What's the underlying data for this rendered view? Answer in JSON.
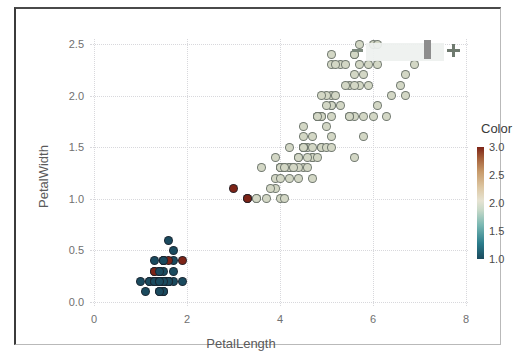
{
  "chart_data": {
    "type": "scatter",
    "title": "",
    "xlabel": "PetalLength",
    "ylabel": "PetalWidth",
    "xlim": [
      0,
      8
    ],
    "ylim": [
      0.0,
      2.5
    ],
    "xticks": [
      "0",
      "2",
      "4",
      "6",
      "8"
    ],
    "xtick_values": [
      0,
      2,
      4,
      6,
      8
    ],
    "yticks": [
      "0.0",
      "0.5",
      "1.0",
      "1.5",
      "2.0",
      "2.5"
    ],
    "ytick_values": [
      0.0,
      0.5,
      1.0,
      1.5,
      2.0,
      2.5
    ],
    "grid": true,
    "grid_style": "dotted",
    "legend": {
      "title": "Color",
      "position": "right",
      "ticks": [
        "3.0",
        "2.5",
        "2.0",
        "1.5",
        "1.0"
      ],
      "tick_values": [
        3.0,
        2.5,
        2.0,
        1.5,
        1.0
      ],
      "vmin": 1.0,
      "vmax": 3.0,
      "colormap": "diverging teal-beige-brown",
      "low_color": "#1b4a5e",
      "mid_color": "#e6e3d2",
      "high_color": "#7d2417"
    },
    "color_variable": "Color",
    "series": [
      {
        "name": "points",
        "x": [
          1.4,
          1.4,
          1.3,
          1.5,
          1.4,
          1.7,
          1.4,
          1.5,
          1.4,
          1.5,
          1.5,
          1.6,
          1.4,
          1.1,
          1.2,
          1.5,
          1.3,
          1.4,
          1.7,
          1.5,
          1.7,
          1.5,
          1.0,
          1.7,
          1.9,
          1.6,
          1.6,
          1.5,
          1.4,
          1.6,
          1.6,
          1.5,
          1.5,
          1.4,
          1.5,
          1.2,
          1.3,
          1.4,
          1.3,
          1.5,
          1.3,
          1.3,
          1.3,
          1.6,
          1.9,
          1.4,
          1.6,
          1.4,
          1.5,
          1.4,
          4.7,
          4.5,
          4.9,
          4.0,
          4.6,
          4.5,
          4.7,
          3.3,
          4.6,
          3.9,
          3.5,
          4.2,
          4.0,
          4.7,
          3.6,
          4.4,
          4.5,
          4.1,
          4.5,
          3.9,
          4.8,
          4.0,
          4.9,
          4.7,
          4.3,
          4.4,
          4.8,
          5.0,
          4.5,
          3.5,
          3.8,
          3.7,
          3.9,
          5.1,
          4.5,
          4.5,
          4.7,
          4.4,
          4.1,
          4.0,
          4.4,
          4.6,
          4.0,
          3.3,
          4.2,
          4.2,
          4.2,
          4.3,
          3.0,
          4.1,
          6.0,
          5.1,
          5.9,
          5.6,
          5.8,
          6.6,
          4.5,
          6.3,
          5.8,
          6.1,
          5.1,
          5.3,
          5.5,
          5.0,
          5.1,
          5.3,
          5.5,
          6.7,
          6.9,
          5.0,
          5.7,
          4.9,
          6.7,
          4.9,
          5.7,
          6.0,
          4.8,
          4.9,
          5.6,
          5.8,
          6.1,
          6.4,
          5.6,
          5.1,
          5.6,
          6.1,
          5.6,
          5.5,
          4.8,
          5.4,
          5.6,
          5.1,
          5.1,
          5.9,
          5.7,
          5.2,
          5.0,
          5.2,
          5.4,
          5.1
        ],
        "y": [
          0.2,
          0.2,
          0.2,
          0.2,
          0.2,
          0.4,
          0.3,
          0.2,
          0.2,
          0.1,
          0.2,
          0.2,
          0.1,
          0.1,
          0.2,
          0.4,
          0.4,
          0.3,
          0.3,
          0.3,
          0.2,
          0.4,
          0.2,
          0.5,
          0.2,
          0.2,
          0.4,
          0.2,
          0.2,
          0.2,
          0.2,
          0.4,
          0.1,
          0.2,
          0.2,
          0.2,
          0.2,
          0.1,
          0.2,
          0.2,
          0.3,
          0.3,
          0.2,
          0.6,
          0.4,
          0.3,
          0.2,
          0.2,
          0.2,
          0.2,
          1.4,
          1.5,
          1.5,
          1.3,
          1.5,
          1.3,
          1.6,
          1.0,
          1.3,
          1.4,
          1.0,
          1.5,
          1.0,
          1.4,
          1.3,
          1.4,
          1.5,
          1.0,
          1.5,
          1.1,
          1.8,
          1.3,
          1.5,
          1.2,
          1.3,
          1.4,
          1.4,
          1.7,
          1.5,
          1.0,
          1.1,
          1.0,
          1.2,
          1.6,
          1.5,
          1.6,
          1.5,
          1.3,
          1.3,
          1.3,
          1.2,
          1.4,
          1.2,
          1.0,
          1.3,
          1.2,
          1.3,
          1.3,
          1.1,
          1.3,
          2.5,
          1.9,
          2.1,
          1.8,
          2.2,
          2.1,
          1.7,
          1.8,
          1.8,
          2.5,
          2.0,
          1.9,
          2.1,
          2.0,
          2.4,
          2.3,
          1.8,
          2.2,
          2.3,
          1.5,
          2.3,
          2.0,
          2.0,
          1.8,
          2.1,
          1.8,
          1.8,
          1.8,
          2.1,
          1.6,
          1.9,
          2.0,
          2.2,
          1.5,
          1.4,
          2.3,
          2.4,
          1.8,
          1.8,
          2.1,
          2.4,
          2.3,
          1.9,
          2.3,
          2.5,
          2.3,
          1.9,
          2.0,
          2.3,
          1.8
        ],
        "c": [
          1,
          1,
          1,
          1,
          1,
          1,
          1,
          1,
          1,
          1,
          1,
          1,
          1,
          1,
          1,
          1,
          1,
          3,
          1,
          1,
          1,
          3,
          1,
          1,
          1,
          1,
          3,
          1,
          1,
          1,
          1,
          1,
          1,
          1,
          1,
          1,
          1,
          1,
          1,
          1,
          1,
          3,
          1,
          1,
          3,
          1,
          1,
          1,
          1,
          1,
          2,
          2,
          2,
          2,
          2,
          2,
          2,
          3,
          2,
          2,
          2,
          2,
          2,
          2,
          2,
          2,
          2,
          2,
          2,
          2,
          2,
          2,
          2,
          2,
          2,
          2,
          2,
          2,
          2,
          2,
          2,
          2,
          2,
          2,
          2,
          2,
          2,
          2,
          2,
          2,
          2,
          2,
          2,
          3,
          2,
          2,
          2,
          2,
          3,
          2,
          2,
          2,
          2,
          2,
          2,
          2,
          2,
          2,
          2,
          2,
          2,
          2,
          2,
          2,
          2,
          2,
          2,
          2,
          2,
          2,
          2,
          2,
          2,
          2,
          2,
          2,
          2,
          2,
          2,
          2,
          2,
          2,
          2,
          2,
          2,
          2,
          2,
          2,
          2,
          2,
          2,
          2,
          2,
          2,
          2,
          2,
          2,
          2,
          2,
          2
        ]
      }
    ]
  },
  "widgets": {
    "zoom_slider": {
      "minus_label": "−",
      "plus_label": "+",
      "handle_position_percent": 80
    }
  }
}
